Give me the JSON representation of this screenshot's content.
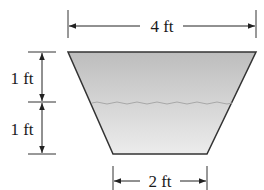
{
  "diagram": {
    "type": "trapezoidal-tank-cross-section",
    "top_width_label": "4 ft",
    "bottom_width_label": "2 ft",
    "upper_height_label": "1 ft",
    "lower_height_label": "1 ft",
    "colors": {
      "fill_top": "#bdbdbd",
      "fill_bottom": "#e6e6e6",
      "outline": "#333333",
      "water_line": "#a8a8a8",
      "dimension_line": "#222222"
    }
  }
}
